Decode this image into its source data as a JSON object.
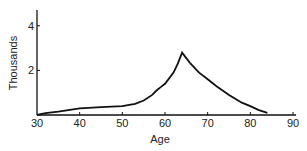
{
  "chart_data": {
    "type": "line",
    "title": "",
    "xlabel": "Age",
    "ylabel": "Thousands",
    "xlim": [
      30,
      90
    ],
    "ylim": [
      0,
      4.5
    ],
    "xticks": [
      30,
      40,
      50,
      60,
      70,
      80,
      90
    ],
    "yticks": [
      2,
      4
    ],
    "grid": false,
    "legend": null,
    "series": [
      {
        "name": "",
        "x": [
          30,
          32,
          35,
          40,
          45,
          50,
          53,
          55,
          57,
          58,
          59,
          60,
          62,
          63,
          64,
          65,
          66,
          68,
          70,
          72,
          75,
          78,
          80,
          82,
          84
        ],
        "values": [
          0.0,
          0.08,
          0.15,
          0.3,
          0.35,
          0.4,
          0.5,
          0.65,
          0.9,
          1.1,
          1.25,
          1.4,
          1.9,
          2.3,
          2.8,
          2.55,
          2.3,
          1.9,
          1.6,
          1.3,
          0.9,
          0.55,
          0.4,
          0.22,
          0.1
        ]
      }
    ]
  },
  "axes": {
    "x_title": "Age",
    "y_title": "Thousands",
    "x_tick_labels": [
      "30",
      "40",
      "50",
      "60",
      "70",
      "80",
      "90"
    ],
    "y_tick_labels": [
      "2",
      "4"
    ]
  }
}
